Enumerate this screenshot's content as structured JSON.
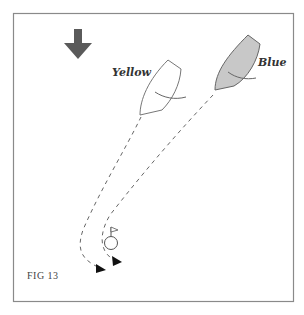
{
  "figure": {
    "label": "FIG 13",
    "frame_color": "#888888",
    "background": "#ffffff"
  },
  "wind": {
    "icon": "wind-direction-arrow-icon",
    "direction": "down",
    "color": "#5a5a5a"
  },
  "boats": [
    {
      "name": "Yellow",
      "fill": "#ffffff",
      "stroke": "#777777"
    },
    {
      "name": "Blue",
      "fill": "#c8c8c8",
      "stroke": "#666666"
    }
  ],
  "mark": {
    "icon": "flag-mark-icon",
    "stroke": "#555555"
  },
  "tracks": [
    {
      "boat": "Yellow",
      "style": "dashed",
      "ends_with": "arrowhead"
    },
    {
      "boat": "Blue",
      "style": "dashed",
      "ends_with": "arrowhead"
    }
  ]
}
